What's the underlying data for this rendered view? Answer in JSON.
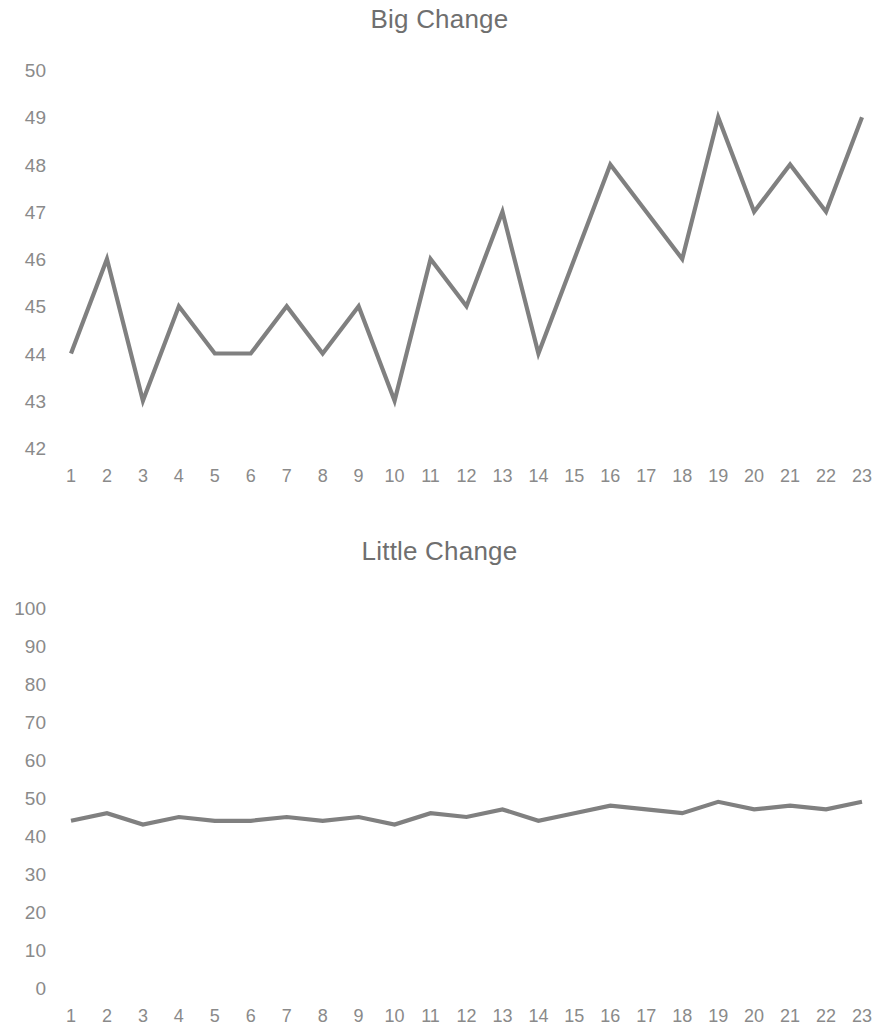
{
  "chart_data": [
    {
      "type": "line",
      "title": "Big Change",
      "xlabel": "",
      "ylabel": "",
      "x": [
        1,
        2,
        3,
        4,
        5,
        6,
        7,
        8,
        9,
        10,
        11,
        12,
        13,
        14,
        15,
        16,
        17,
        18,
        19,
        20,
        21,
        22,
        23
      ],
      "values": [
        44,
        46,
        43,
        45,
        44,
        44,
        45,
        44,
        45,
        43,
        46,
        45,
        47,
        44,
        46,
        48,
        47,
        46,
        49,
        47,
        48,
        47,
        49
      ],
      "categories": [
        "1",
        "2",
        "3",
        "4",
        "5",
        "6",
        "7",
        "8",
        "9",
        "10",
        "11",
        "12",
        "13",
        "14",
        "15",
        "16",
        "17",
        "18",
        "19",
        "20",
        "21",
        "22",
        "23"
      ],
      "ytick_labels": [
        "50",
        "49",
        "48",
        "47",
        "46",
        "45",
        "44",
        "43",
        "42"
      ],
      "ytick_values": [
        50,
        49,
        48,
        47,
        46,
        45,
        44,
        43,
        42
      ],
      "ylim": [
        42,
        50
      ],
      "xlim": [
        1,
        23
      ],
      "grid": false,
      "legend": false,
      "series_color": "#808080"
    },
    {
      "type": "line",
      "title": "Little Change",
      "xlabel": "",
      "ylabel": "",
      "x": [
        1,
        2,
        3,
        4,
        5,
        6,
        7,
        8,
        9,
        10,
        11,
        12,
        13,
        14,
        15,
        16,
        17,
        18,
        19,
        20,
        21,
        22,
        23
      ],
      "values": [
        44,
        46,
        43,
        45,
        44,
        44,
        45,
        44,
        45,
        43,
        46,
        45,
        47,
        44,
        46,
        48,
        47,
        46,
        49,
        47,
        48,
        47,
        49
      ],
      "categories": [
        "1",
        "2",
        "3",
        "4",
        "5",
        "6",
        "7",
        "8",
        "9",
        "10",
        "11",
        "12",
        "13",
        "14",
        "15",
        "16",
        "17",
        "18",
        "19",
        "20",
        "21",
        "22",
        "23"
      ],
      "ytick_labels": [
        "100",
        "90",
        "80",
        "70",
        "60",
        "50",
        "40",
        "30",
        "20",
        "10",
        "0"
      ],
      "ytick_values": [
        100,
        90,
        80,
        70,
        60,
        50,
        40,
        30,
        20,
        10,
        0
      ],
      "ylim": [
        0,
        100
      ],
      "xlim": [
        1,
        23
      ],
      "grid": false,
      "legend": false,
      "series_color": "#808080"
    }
  ],
  "colors": {
    "background": "#ffffff",
    "series": "#808080",
    "tick_text": "#8a8a8a",
    "title_text": "#6f6f6f"
  }
}
